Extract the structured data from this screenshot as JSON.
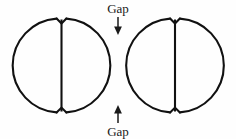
{
  "figure": {
    "background_color": "#fefefe",
    "stroke_color": "#111111",
    "text_color": "#1a1a1a",
    "labels": {
      "top_gap": "Gap",
      "bottom_gap": "Gap"
    },
    "icons": {
      "top_arrow": "arrow-down-icon",
      "bottom_arrow": "arrow-up-icon"
    },
    "shapes": [
      {
        "name": "left-circle",
        "cx": 61.5,
        "cy": 65.5,
        "r": 47,
        "web_x": 61.5,
        "web_top_y": 18,
        "web_bottom_y": 113,
        "notch_half_width": 5,
        "notch_depth": 5
      },
      {
        "name": "right-circle",
        "cx": 175,
        "cy": 65.5,
        "r": 47,
        "web_x": 175,
        "web_top_y": 18,
        "web_bottom_y": 113,
        "notch_half_width": 5,
        "notch_depth": 5
      }
    ],
    "annotations": [
      {
        "name": "top-gap-annotation",
        "label": "Gap",
        "label_x": 118,
        "label_y": 13,
        "arrow_x": 118,
        "arrow_y1": 18,
        "arrow_y2": 33,
        "direction": "down"
      },
      {
        "name": "bottom-gap-annotation",
        "label": "Gap",
        "label_x": 118,
        "label_y": 136,
        "arrow_x": 118,
        "arrow_y1": 123,
        "arrow_y2": 108,
        "direction": "up"
      }
    ]
  }
}
